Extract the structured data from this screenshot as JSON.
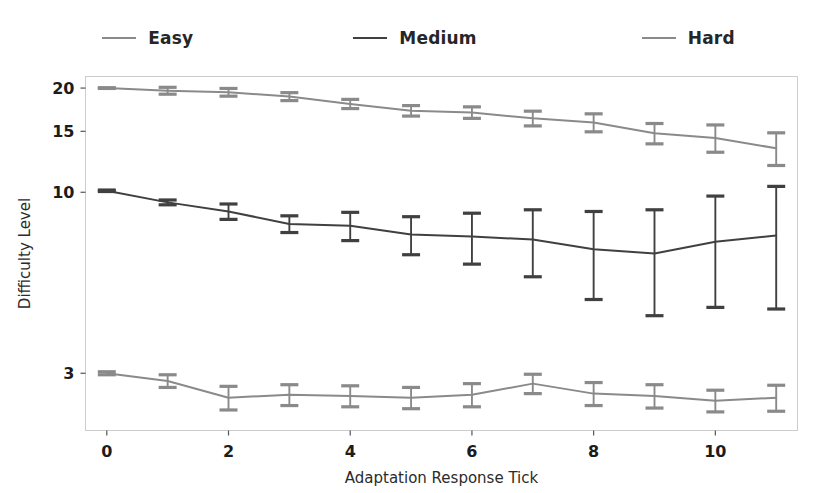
{
  "legend": {
    "position": "above-axes",
    "entries": [
      {
        "label": "Easy",
        "color": "#8a8a8a",
        "name": "legend-easy"
      },
      {
        "label": "Medium",
        "color": "#404040",
        "name": "legend-medium"
      },
      {
        "label": "Hard",
        "color": "#8a8a8a",
        "name": "legend-hard"
      }
    ]
  },
  "axes": {
    "xlabel": "Adaptation Response Tick",
    "ylabel": "Difficulty Level",
    "xticks": [
      "0",
      "2",
      "4",
      "6",
      "8",
      "10"
    ],
    "yticks": [
      "20",
      "15",
      "10",
      "3"
    ]
  },
  "chart_data": {
    "type": "line",
    "title": "",
    "xlabel": "Adaptation Response Tick",
    "ylabel": "Difficulty Level",
    "xlim": [
      -0.35,
      11.35
    ],
    "ylim": [
      2.05,
      21.6
    ],
    "yscale": "log",
    "grid": false,
    "legend_position": "above-axes",
    "errorbars": true,
    "x": [
      0,
      1,
      2,
      3,
      4,
      5,
      6,
      7,
      8,
      9,
      10,
      11
    ],
    "xtick_values": [
      0,
      2,
      4,
      6,
      8,
      10
    ],
    "ytick_values": [
      20,
      15,
      10,
      3
    ],
    "series": [
      {
        "name": "Easy",
        "color": "#8a8a8a",
        "values": [
          20.0,
          19.65,
          19.45,
          18.9,
          18.0,
          17.2,
          17.0,
          16.35,
          15.9,
          14.8,
          14.35,
          13.4
        ],
        "err": [
          0.05,
          0.45,
          0.5,
          0.5,
          0.55,
          0.6,
          0.65,
          0.8,
          0.95,
          1.0,
          1.3,
          1.45
        ]
      },
      {
        "name": "Medium",
        "color": "#404040",
        "values": [
          10.1,
          9.35,
          8.8,
          8.1,
          8.0,
          7.55,
          7.45,
          7.3,
          6.85,
          6.65,
          7.2,
          7.5
        ],
        "err": [
          0.05,
          0.15,
          0.45,
          0.45,
          0.75,
          0.95,
          1.25,
          1.6,
          1.95,
          2.25,
          2.55,
          2.9
        ]
      },
      {
        "name": "Hard",
        "color": "#8a8a8a",
        "values": [
          3.0,
          2.85,
          2.55,
          2.6,
          2.58,
          2.55,
          2.6,
          2.8,
          2.62,
          2.58,
          2.5,
          2.55
        ]
      }
    ],
    "hard_err": [
      0.03,
      0.12,
      0.2,
      0.18,
      0.18,
      0.18,
      0.2,
      0.18,
      0.2,
      0.2,
      0.18,
      0.22
    ]
  }
}
